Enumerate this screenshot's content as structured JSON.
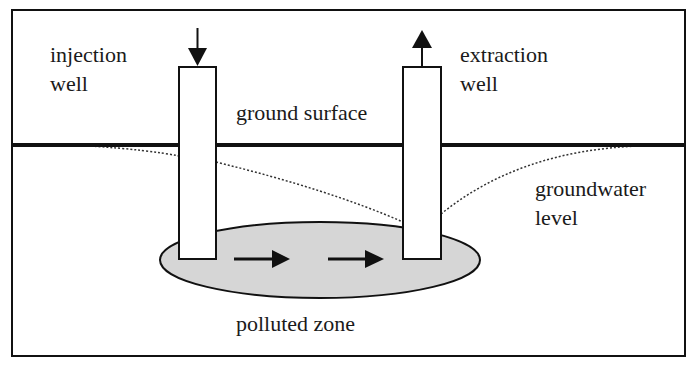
{
  "diagram": {
    "type": "groundwater-remediation-schematic",
    "labels": {
      "injection_well": [
        "injection",
        "well"
      ],
      "extraction_well": [
        "extraction",
        "well"
      ],
      "ground_surface": "ground surface",
      "groundwater_level": [
        "groundwater",
        "level"
      ],
      "polluted_zone": "polluted zone"
    },
    "arrows": {
      "injection_direction": "down",
      "extraction_direction": "up",
      "flow_direction": "left-to-right",
      "flow_arrow_count": 2
    },
    "colors": {
      "line": "#111111",
      "polluted_zone_fill": "#d6d6d6",
      "background": "#ffffff"
    }
  }
}
